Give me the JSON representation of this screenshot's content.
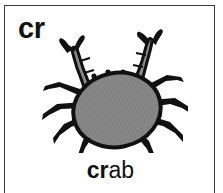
{
  "card": {
    "digraph": "cr",
    "word": {
      "full": "crab",
      "onset": "cr",
      "rime": "ab"
    },
    "illustration": {
      "name": "crab-illustration",
      "subject": "crab",
      "body_color": "#8a8a8a",
      "outline_color": "#111111",
      "limb_color": "#8f8f8f",
      "claw_count": 2,
      "leg_count": 8
    },
    "border_color": "#3a3a3c",
    "background_color": "#ffffff",
    "text_color": "#111111"
  }
}
